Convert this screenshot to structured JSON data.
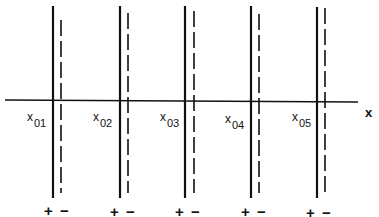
{
  "diagram": {
    "type": "planar double-layer / surface charge sheets along x-axis",
    "axis": {
      "label": "x"
    },
    "sheets": [
      {
        "label_base": "x",
        "label_sub": "01",
        "plus": "+",
        "minus": "−"
      },
      {
        "label_base": "x",
        "label_sub": "02",
        "plus": "+",
        "minus": "−"
      },
      {
        "label_base": "x",
        "label_sub": "03",
        "plus": "+",
        "minus": "−"
      },
      {
        "label_base": "x",
        "label_sub": "04",
        "plus": "+",
        "minus": "−"
      },
      {
        "label_base": "x",
        "label_sub": "05",
        "plus": "+",
        "minus": "−"
      }
    ],
    "legend": {
      "solid_line": "positive sheet (+)",
      "dashed_line": "negative sheet (−)"
    },
    "colors": {
      "line": "#111111",
      "background": "#ffffff"
    }
  }
}
